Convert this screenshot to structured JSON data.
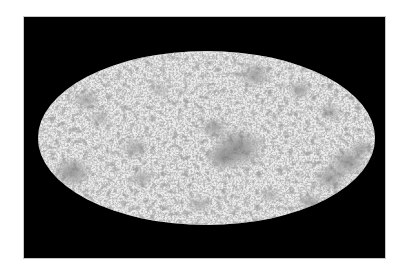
{
  "figure": {
    "background_color": "#000000",
    "page_color": "#ffffff",
    "map_base_light": "#e6e6e6",
    "map_dark_spot_color": "#5a5a5a",
    "projection": "mollweide",
    "ellipse": {
      "cx": 206.5,
      "cy": 138,
      "rx": 168.5,
      "ry": 87
    },
    "frame": {
      "x": 24,
      "y": 17,
      "width": 361,
      "height": 241
    },
    "dark_clusters": [
      {
        "x": 238,
        "y": 148,
        "r": 22,
        "o": 0.55
      },
      {
        "x": 222,
        "y": 158,
        "r": 14,
        "o": 0.45
      },
      {
        "x": 214,
        "y": 128,
        "r": 12,
        "o": 0.4
      },
      {
        "x": 72,
        "y": 172,
        "r": 16,
        "o": 0.5
      },
      {
        "x": 135,
        "y": 148,
        "r": 12,
        "o": 0.35
      },
      {
        "x": 142,
        "y": 178,
        "r": 10,
        "o": 0.35
      },
      {
        "x": 348,
        "y": 162,
        "r": 16,
        "o": 0.5
      },
      {
        "x": 362,
        "y": 148,
        "r": 10,
        "o": 0.4
      },
      {
        "x": 330,
        "y": 178,
        "r": 14,
        "o": 0.45
      },
      {
        "x": 255,
        "y": 75,
        "r": 14,
        "o": 0.4
      },
      {
        "x": 300,
        "y": 90,
        "r": 10,
        "o": 0.4
      },
      {
        "x": 330,
        "y": 112,
        "r": 10,
        "o": 0.35
      },
      {
        "x": 86,
        "y": 100,
        "r": 12,
        "o": 0.35
      },
      {
        "x": 100,
        "y": 118,
        "r": 9,
        "o": 0.3
      },
      {
        "x": 310,
        "y": 202,
        "r": 10,
        "o": 0.4
      },
      {
        "x": 200,
        "y": 205,
        "r": 10,
        "o": 0.3
      },
      {
        "x": 160,
        "y": 90,
        "r": 9,
        "o": 0.25
      },
      {
        "x": 270,
        "y": 195,
        "r": 9,
        "o": 0.3
      }
    ]
  }
}
